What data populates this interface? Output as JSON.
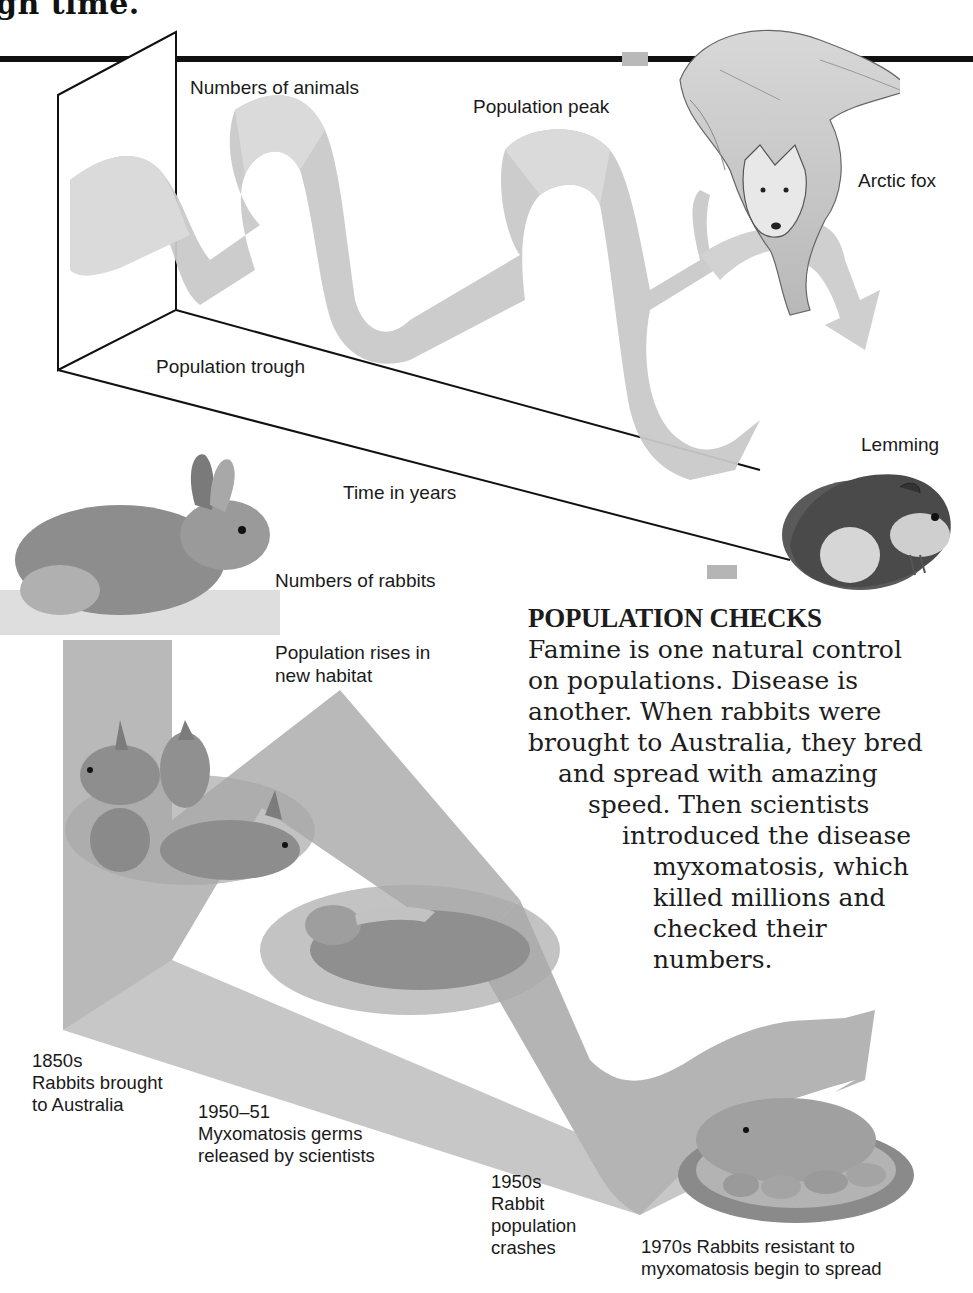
{
  "page": {
    "heading_fragment": "gh time."
  },
  "top_diagram": {
    "y_axis_label": "Numbers of animals",
    "x_axis_label": "Time in years",
    "peak_label": "Population peak",
    "trough_label": "Population trough",
    "animals": [
      {
        "name": "Arctic fox",
        "icon": "arctic-fox-illustration"
      },
      {
        "name": "Lemming",
        "icon": "lemming-illustration"
      }
    ],
    "ribbon_color": "#c4c4c4"
  },
  "bottom_diagram": {
    "y_axis_label": "Numbers of rabbits",
    "rise_label": "Population rises in new habitat",
    "ribbon_color": "#b8b8b8",
    "events": [
      {
        "date": "1850s",
        "text": "Rabbits brought to Australia"
      },
      {
        "date": "1950–51",
        "text": "Myxomatosis germs released by scientists"
      },
      {
        "date": "1950s",
        "text": "Rabbit population crashes"
      },
      {
        "date": "1970s",
        "text": "Rabbits resistant to myxomatosis  begin to spread"
      }
    ]
  },
  "sidebar_text": {
    "title": "POPULATION CHECKS",
    "lines": [
      "Famine is one natural control",
      "on populations. Disease is",
      "another. When rabbits were",
      "brought to Australia, they bred",
      "and spread with amazing",
      "speed. Then scientists",
      "introduced the disease",
      "myxomatosis, which",
      "killed millions and",
      "checked their",
      "numbers."
    ]
  }
}
